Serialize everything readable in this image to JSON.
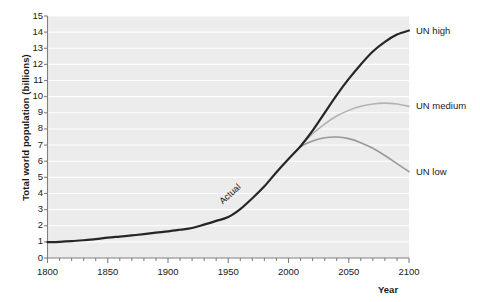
{
  "chart_data": {
    "type": "line",
    "title": "",
    "xlabel": "Year",
    "ylabel": "Total world population (billions)",
    "xlim": [
      1800,
      2100
    ],
    "ylim": [
      0,
      15
    ],
    "grid": true,
    "legend_position": "right-inline",
    "xticks": [
      1800,
      1850,
      1900,
      1950,
      2000,
      2050,
      2100
    ],
    "xtick_labels": [
      "1800",
      "1850",
      "1900",
      "1950",
      "2000",
      "2050",
      "2100"
    ],
    "xminor_step": 10,
    "yticks": [
      0,
      1,
      2,
      3,
      4,
      5,
      6,
      7,
      8,
      9,
      10,
      11,
      12,
      13,
      14,
      15
    ],
    "ytick_labels": [
      "0",
      "1",
      "2",
      "3",
      "4",
      "5",
      "6",
      "7",
      "8",
      "9",
      "10",
      "11",
      "12",
      "13",
      "14",
      "15"
    ],
    "annotations": [
      {
        "text": "Actual",
        "x": 1965,
        "y": 3.5
      }
    ],
    "series": [
      {
        "name": "Actual",
        "label": "",
        "color": "#262626",
        "width": 2.2,
        "x": [
          1800,
          1810,
          1820,
          1830,
          1840,
          1850,
          1860,
          1870,
          1880,
          1890,
          1900,
          1910,
          1920,
          1930,
          1940,
          1950,
          1960,
          1970,
          1980,
          1990,
          2000,
          2010
        ],
        "values": [
          0.98,
          1.0,
          1.04,
          1.1,
          1.17,
          1.26,
          1.33,
          1.4,
          1.48,
          1.57,
          1.65,
          1.75,
          1.86,
          2.07,
          2.3,
          2.54,
          3.03,
          3.7,
          4.44,
          5.32,
          6.14,
          6.92
        ]
      },
      {
        "name": "UN high",
        "label": "UN high",
        "color": "#262626",
        "width": 2.2,
        "x": [
          2010,
          2020,
          2030,
          2040,
          2050,
          2060,
          2070,
          2080,
          2090,
          2100
        ],
        "values": [
          6.92,
          7.9,
          9.0,
          10.1,
          11.1,
          12.0,
          12.8,
          13.4,
          13.85,
          14.1
        ]
      },
      {
        "name": "UN medium",
        "label": "UN medium",
        "color": "#b3b3b3",
        "width": 1.6,
        "x": [
          2010,
          2020,
          2030,
          2040,
          2050,
          2060,
          2070,
          2080,
          2090,
          2100
        ],
        "values": [
          6.92,
          7.7,
          8.3,
          8.8,
          9.15,
          9.4,
          9.55,
          9.6,
          9.55,
          9.4
        ]
      },
      {
        "name": "UN low",
        "label": "UN low",
        "color": "#999999",
        "width": 1.6,
        "x": [
          2010,
          2020,
          2030,
          2040,
          2050,
          2060,
          2070,
          2080,
          2090,
          2100
        ],
        "values": [
          6.92,
          7.25,
          7.45,
          7.5,
          7.4,
          7.15,
          6.8,
          6.35,
          5.85,
          5.35
        ]
      }
    ],
    "colors": {
      "plot_background": "#ebebeb",
      "gridline": "#ffffff",
      "axis": "#808080",
      "text": "#1a1a1a",
      "actual_line": "#262626"
    }
  }
}
